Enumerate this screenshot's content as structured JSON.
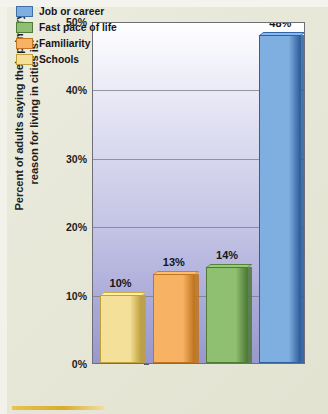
{
  "colors": {
    "page_background": "#e8e8da",
    "plot_background_top": "#ffffff",
    "plot_background_bottom": "#9898cc",
    "gridline": "#7a7a86",
    "axis_border": "#6e6e78",
    "text": "#15151a",
    "bottom_rule": "#d9ab2c",
    "job_or_career": "#7FAEE0",
    "fast_pace_of_life": "#8FBF70",
    "familiarity": "#F7B264",
    "schools": "#F5E09A"
  },
  "axis": {
    "y_title_line1": "Percent of adults saying their primary",
    "y_title_line2": "reason for living in cities is:",
    "y_title": "Percent of adults saying their primary reason for living in cities is:"
  },
  "legend": {
    "items": [
      {
        "label": "Job or career",
        "color": "#7FAEE0",
        "border": "#3f6fa8"
      },
      {
        "label": "Fast pace of life",
        "color": "#8FBF70",
        "border": "#4f7a38"
      },
      {
        "label": "Familiarity",
        "color": "#F7B264",
        "border": "#c07620"
      },
      {
        "label": "Schools",
        "color": "#F5E09A",
        "border": "#bfa03c"
      }
    ]
  },
  "chart_data": {
    "type": "bar",
    "title": "",
    "xlabel": "",
    "ylabel": "Percent of adults saying their primary reason for living in cities is:",
    "categories": [
      "Schools",
      "Familiarity",
      "Fast pace of life",
      "Job or career"
    ],
    "values": [
      10,
      13,
      14,
      48
    ],
    "value_labels": [
      "10%",
      "13%",
      "14%",
      "48%"
    ],
    "ylim": [
      0,
      50
    ],
    "yticks": [
      0,
      10,
      20,
      30,
      40,
      50
    ],
    "ytick_labels": [
      "0%",
      "10%",
      "20%",
      "30%",
      "40%",
      "50%"
    ],
    "grid": true,
    "legend_position": "top-left",
    "series": [
      {
        "name": "Percent of adults",
        "points": [
          {
            "category": "Schools",
            "value": 10,
            "label": "10%",
            "color": "#F5E09A",
            "border": "#bfa03c"
          },
          {
            "category": "Familiarity",
            "value": 13,
            "label": "13%",
            "color": "#F7B264",
            "border": "#c07620"
          },
          {
            "category": "Fast pace of life",
            "value": 14,
            "label": "14%",
            "color": "#8FBF70",
            "border": "#4f7a38"
          },
          {
            "category": "Job or career",
            "value": 48,
            "label": "48%",
            "color": "#7FAEE0",
            "border": "#2f5f9c"
          }
        ]
      }
    ]
  }
}
